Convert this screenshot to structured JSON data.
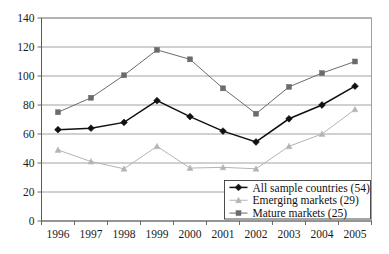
{
  "chart_data": {
    "type": "line",
    "title": "",
    "subtitle": "",
    "xlabel": "",
    "ylabel": "",
    "categories": [
      "1996",
      "1997",
      "1998",
      "1999",
      "2000",
      "2001",
      "2002",
      "2003",
      "2004",
      "2005"
    ],
    "ylim": [
      0,
      140
    ],
    "ytick_values": [
      0,
      20,
      40,
      60,
      80,
      100,
      120,
      140
    ],
    "ytick_labels": [
      "0",
      "20",
      "40",
      "60",
      "80",
      "100",
      "120",
      "140"
    ],
    "grid": "horizontal",
    "legend_position": "bottom-right",
    "series": [
      {
        "name": "All sample countries (54)",
        "marker": "diamond",
        "color": "#111111",
        "values": [
          63,
          64,
          68,
          83,
          72,
          62,
          54.5,
          70.5,
          80,
          93
        ]
      },
      {
        "name": "Emerging markets (29)",
        "marker": "triangle",
        "color": "#b4b4b4",
        "values": [
          49,
          41,
          36,
          51.5,
          36.5,
          37,
          36,
          51.5,
          60,
          77
        ]
      },
      {
        "name": "Mature markets (25)",
        "marker": "square",
        "color": "#6b6b6b",
        "values": [
          75,
          85,
          100.5,
          118,
          111.5,
          91.5,
          74,
          92.5,
          102,
          110
        ]
      }
    ]
  },
  "legend": {
    "entries": [
      {
        "label": "All sample countries (54)"
      },
      {
        "label": "Emerging markets (29)"
      },
      {
        "label": "Mature markets (25)"
      }
    ]
  },
  "colors": {
    "background": "#ffffff",
    "grid": "#8a8a8a",
    "axis": "#5a5a5a",
    "series_all": "#111111",
    "series_emerging": "#b4b4b4",
    "series_mature": "#6b6b6b"
  }
}
